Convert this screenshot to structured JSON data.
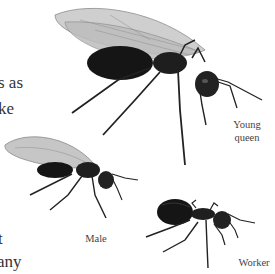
{
  "page": {
    "text_fragments": [
      "s as",
      "ke",
      "t",
      "any"
    ]
  },
  "illustrations": [
    {
      "name": "young-queen",
      "label_line1": "Young",
      "label_line2": "queen"
    },
    {
      "name": "male",
      "label": "Male"
    },
    {
      "name": "worker",
      "label": "Worker"
    }
  ],
  "colors": {
    "background": "#ffffff",
    "ant_body": "#1a1a1a",
    "wing": "#c8c8c8",
    "text": "#333333"
  }
}
